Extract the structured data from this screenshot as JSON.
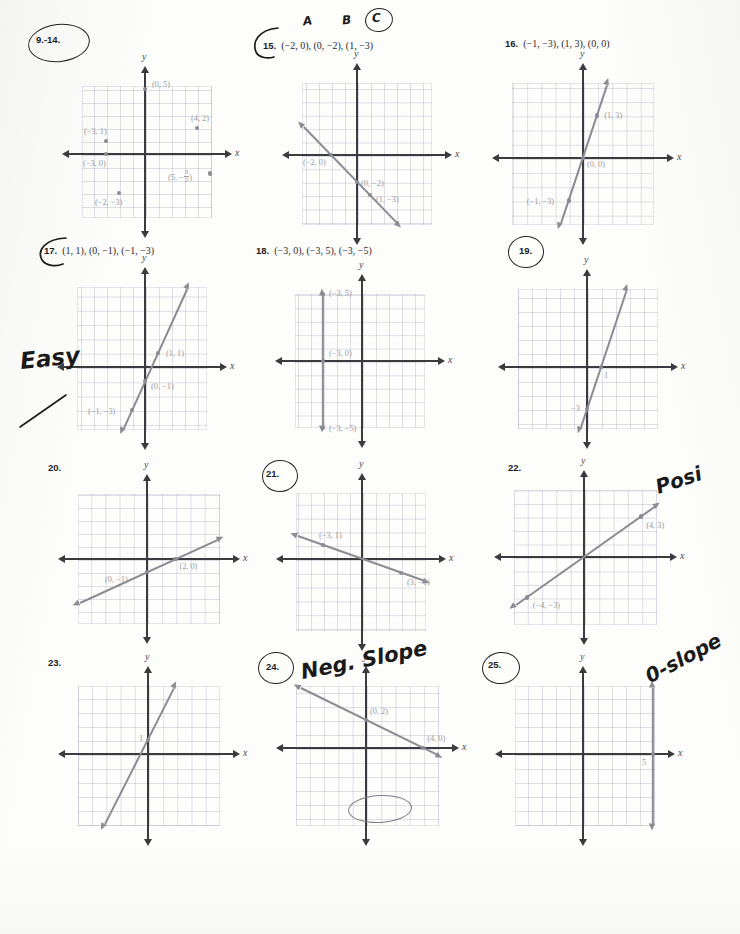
{
  "document": {
    "kind": "math-worksheet-scan",
    "subject": "Graphing points and lines on the coordinate plane"
  },
  "axis_labels": {
    "x": "x",
    "y": "y"
  },
  "handwriting": [
    {
      "name": "circle-9-14",
      "text": "",
      "kind": "ellipse"
    },
    {
      "name": "letter-a",
      "text": "A",
      "kind": "text"
    },
    {
      "name": "letter-b",
      "text": "B",
      "kind": "text"
    },
    {
      "name": "letter-c",
      "text": "C",
      "kind": "text"
    },
    {
      "name": "easy-note",
      "text": "Easy",
      "kind": "text"
    },
    {
      "name": "posi-note",
      "text": "Posi",
      "kind": "text"
    },
    {
      "name": "neg-slope-note",
      "text": "Neg. Slope",
      "kind": "text"
    },
    {
      "name": "zero-slope-note",
      "text": "0-slope",
      "kind": "text"
    }
  ],
  "problems": [
    {
      "id": "9-14",
      "number": "9.-14.",
      "points_text": "",
      "circled": true,
      "chart_data": {
        "type": "scatter",
        "title": "9.-14.",
        "xlabel": "x",
        "ylabel": "y",
        "xlim": [
          -5,
          5
        ],
        "ylim": [
          -5,
          5
        ],
        "grid": true,
        "points": [
          {
            "x": 0,
            "y": 5,
            "label": "(0, 5)"
          },
          {
            "x": 4,
            "y": 2,
            "label": "(4, 2)"
          },
          {
            "x": -3,
            "y": 1,
            "label": "(−3, 1)"
          },
          {
            "x": -3,
            "y": 0,
            "label": "(−3, 0)"
          },
          {
            "x": 5,
            "y": -1.5,
            "label": "(5, −½)"
          },
          {
            "x": -2,
            "y": -3,
            "label": "(−2, −3)"
          }
        ],
        "lines": []
      }
    },
    {
      "id": "15",
      "number": "15.",
      "points_text": "(−2, 0), (0, −2), (1, −3)",
      "circled": true,
      "chart_data": {
        "type": "line",
        "title": "15.",
        "xlabel": "x",
        "ylabel": "y",
        "xlim": [
          -5,
          5
        ],
        "ylim": [
          -5,
          5
        ],
        "grid": true,
        "slope": -1,
        "intercept": -2,
        "points": [
          {
            "x": -2,
            "y": 0,
            "label": "(−2, 0)"
          },
          {
            "x": 0,
            "y": -2,
            "label": "(0, −2)"
          },
          {
            "x": 1,
            "y": -3,
            "label": "(1, −3)"
          }
        ]
      }
    },
    {
      "id": "16",
      "number": "16.",
      "points_text": "(−1, −3), (1, 3), (0, 0)",
      "circled": false,
      "chart_data": {
        "type": "line",
        "title": "16.",
        "xlabel": "x",
        "ylabel": "y",
        "xlim": [
          -5,
          5
        ],
        "ylim": [
          -5,
          5
        ],
        "grid": true,
        "slope": 3,
        "intercept": 0,
        "points": [
          {
            "x": 1,
            "y": 3,
            "label": "(1, 3)"
          },
          {
            "x": 0,
            "y": 0,
            "label": "(0, 0)"
          },
          {
            "x": -1,
            "y": -3,
            "label": "(−1, −3)"
          }
        ]
      }
    },
    {
      "id": "17",
      "number": "17.",
      "points_text": "(1, 1), (0, −1), (−1, −3)",
      "circled": true,
      "chart_data": {
        "type": "line",
        "title": "17.",
        "xlabel": "x",
        "ylabel": "y",
        "xlim": [
          -5,
          5
        ],
        "ylim": [
          -5,
          5
        ],
        "grid": true,
        "slope": 2,
        "intercept": -1,
        "points": [
          {
            "x": 1,
            "y": 1,
            "label": "(1, 1)"
          },
          {
            "x": 0,
            "y": -1,
            "label": "(0, −1)"
          },
          {
            "x": -1,
            "y": -3,
            "label": "(−1, −3)"
          }
        ]
      }
    },
    {
      "id": "18",
      "number": "18.",
      "points_text": "(−3, 0), (−3, 5), (−3, −5)",
      "circled": false,
      "chart_data": {
        "type": "line",
        "title": "18.",
        "xlabel": "x",
        "ylabel": "y",
        "xlim": [
          -5,
          5
        ],
        "ylim": [
          -5,
          5
        ],
        "grid": true,
        "vertical_at_x": -3,
        "points": [
          {
            "x": -3,
            "y": 5,
            "label": "(−3, 5)"
          },
          {
            "x": -3,
            "y": 0,
            "label": "(−3, 0)"
          },
          {
            "x": -3,
            "y": -5,
            "label": "(−3, −5)"
          }
        ]
      }
    },
    {
      "id": "19",
      "number": "19.",
      "points_text": "",
      "circled": true,
      "chart_data": {
        "type": "line",
        "title": "19.",
        "xlabel": "x",
        "ylabel": "y",
        "xlim": [
          -5,
          5
        ],
        "ylim": [
          -5,
          5
        ],
        "grid": true,
        "slope": 3,
        "intercept": -3,
        "points": [
          {
            "x": 1,
            "y": 0,
            "label": "1"
          },
          {
            "x": 0,
            "y": -3,
            "label": "−3"
          }
        ]
      }
    },
    {
      "id": "20",
      "number": "20.",
      "points_text": "",
      "circled": false,
      "chart_data": {
        "type": "line",
        "title": "20.",
        "xlabel": "x",
        "ylabel": "y",
        "xlim": [
          -5,
          5
        ],
        "ylim": [
          -5,
          5
        ],
        "grid": true,
        "slope": 0.5,
        "intercept": -1,
        "points": [
          {
            "x": 0,
            "y": -1,
            "label": "(0, −1)"
          },
          {
            "x": 2,
            "y": 0,
            "label": "(2, 0)"
          }
        ]
      }
    },
    {
      "id": "21",
      "number": "21.",
      "points_text": "",
      "circled": true,
      "chart_data": {
        "type": "line",
        "title": "21.",
        "xlabel": "x",
        "ylabel": "y",
        "xlim": [
          -5,
          5
        ],
        "ylim": [
          -5,
          5
        ],
        "grid": true,
        "slope": -0.3333,
        "intercept": 0,
        "points": [
          {
            "x": -3,
            "y": 1,
            "label": "(−3, 1)"
          },
          {
            "x": 3,
            "y": -1,
            "label": "(3, −1)"
          }
        ]
      }
    },
    {
      "id": "22",
      "number": "22.",
      "points_text": "",
      "circled": false,
      "chart_data": {
        "type": "line",
        "title": "22.",
        "xlabel": "x",
        "ylabel": "y",
        "xlim": [
          -5,
          5
        ],
        "ylim": [
          -5,
          5
        ],
        "grid": true,
        "slope": 0.75,
        "intercept": 0,
        "points": [
          {
            "x": 4,
            "y": 3,
            "label": "(4, 3)"
          },
          {
            "x": -4,
            "y": -3,
            "label": "(−4, −3)"
          }
        ]
      }
    },
    {
      "id": "23",
      "number": "23.",
      "points_text": "",
      "circled": false,
      "chart_data": {
        "type": "line",
        "title": "23.",
        "xlabel": "x",
        "ylabel": "y",
        "xlim": [
          -5,
          5
        ],
        "ylim": [
          -5,
          5
        ],
        "grid": true,
        "slope": 2,
        "intercept": 1,
        "points": [
          {
            "x": 0,
            "y": 1,
            "label": "1"
          }
        ]
      }
    },
    {
      "id": "24",
      "number": "24.",
      "points_text": "",
      "circled": true,
      "chart_data": {
        "type": "line",
        "title": "24.",
        "xlabel": "x",
        "ylabel": "y",
        "xlim": [
          -5,
          5
        ],
        "ylim": [
          -5,
          5
        ],
        "grid": true,
        "slope": -0.5,
        "intercept": 2,
        "points": [
          {
            "x": 0,
            "y": 2,
            "label": "(0, 2)"
          },
          {
            "x": 4,
            "y": 0,
            "label": "(4, 0)"
          }
        ]
      }
    },
    {
      "id": "25",
      "number": "25.",
      "points_text": "",
      "circled": true,
      "chart_data": {
        "type": "line",
        "title": "25.",
        "xlabel": "x",
        "ylabel": "y",
        "xlim": [
          -5,
          5
        ],
        "ylim": [
          -5,
          5
        ],
        "grid": true,
        "vertical_at_x": 5,
        "points": [
          {
            "x": 5,
            "y": 0,
            "label": "5"
          }
        ]
      }
    }
  ]
}
